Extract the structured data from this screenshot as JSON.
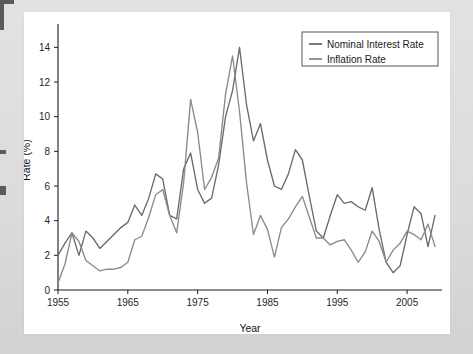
{
  "figure": {
    "panel_bg": "#ffffff",
    "outer_bg": "#dcdcdc",
    "axis_color": "#1c1c1c"
  },
  "legend": {
    "position": "top-right",
    "entries": [
      {
        "label": "Nominal Interest Rate",
        "color": "#6b6b6b"
      },
      {
        "label": "Inflation Rate",
        "color": "#8a8a8a"
      }
    ]
  },
  "chart_data": {
    "type": "line",
    "title": "",
    "xlabel": "Year",
    "ylabel": "Rate (%)",
    "xlim": [
      1955,
      2010
    ],
    "ylim": [
      0,
      15
    ],
    "grid": false,
    "xticks": [
      1955,
      1965,
      1975,
      1985,
      1995,
      2005
    ],
    "xtick_labels": [
      "1955",
      "1965",
      "1975",
      "1985",
      "1995",
      "2005"
    ],
    "yticks": [
      0,
      2,
      4,
      6,
      8,
      10,
      12,
      14
    ],
    "ytick_labels": [
      "0",
      "2",
      "4",
      "6",
      "8",
      "10",
      "12",
      "14"
    ],
    "legend_position": "upper right",
    "x": [
      1955,
      1956,
      1957,
      1958,
      1959,
      1960,
      1961,
      1962,
      1963,
      1964,
      1965,
      1966,
      1967,
      1968,
      1969,
      1970,
      1971,
      1972,
      1973,
      1974,
      1975,
      1976,
      1977,
      1978,
      1979,
      1980,
      1981,
      1982,
      1983,
      1984,
      1985,
      1986,
      1987,
      1988,
      1989,
      1990,
      1991,
      1992,
      1993,
      1994,
      1995,
      1996,
      1997,
      1998,
      1999,
      2000,
      2001,
      2002,
      2003,
      2004,
      2005,
      2006,
      2007,
      2008,
      2009
    ],
    "series": [
      {
        "name": "Nominal Interest Rate",
        "color": "#6b6b6b",
        "values": [
          2.0,
          2.7,
          3.3,
          2.0,
          3.4,
          3.0,
          2.4,
          2.8,
          3.2,
          3.6,
          3.9,
          4.9,
          4.3,
          5.3,
          6.7,
          6.4,
          4.3,
          4.1,
          7.0,
          7.9,
          5.8,
          5.0,
          5.3,
          7.2,
          10.0,
          11.5,
          14.0,
          10.7,
          8.6,
          9.6,
          7.5,
          6.0,
          5.8,
          6.7,
          8.1,
          7.5,
          5.4,
          3.4,
          3.0,
          4.3,
          5.5,
          5.0,
          5.1,
          4.8,
          4.6,
          5.9,
          3.5,
          1.6,
          1.0,
          1.4,
          3.2,
          4.8,
          4.4,
          2.5,
          4.3
        ]
      },
      {
        "name": "Inflation Rate",
        "color": "#8a8a8a",
        "values": [
          0.4,
          1.5,
          3.3,
          2.8,
          1.7,
          1.4,
          1.1,
          1.2,
          1.2,
          1.3,
          1.6,
          2.9,
          3.1,
          4.2,
          5.5,
          5.8,
          4.3,
          3.3,
          6.2,
          11.0,
          9.1,
          5.8,
          6.5,
          7.6,
          11.3,
          13.5,
          10.3,
          6.2,
          3.2,
          4.3,
          3.5,
          1.9,
          3.6,
          4.1,
          4.8,
          5.4,
          4.2,
          3.0,
          3.0,
          2.6,
          2.8,
          2.9,
          2.3,
          1.6,
          2.2,
          3.4,
          2.8,
          1.6,
          2.3,
          2.7,
          3.4,
          3.2,
          2.9,
          3.8,
          2.5
        ]
      }
    ]
  }
}
